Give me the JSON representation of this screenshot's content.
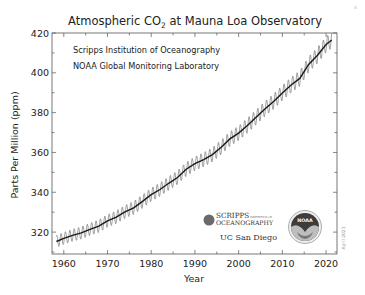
{
  "chart_data": {
    "type": "line",
    "title": "Atmospheric CO2 at Mauna Loa Observatory",
    "title_parts": {
      "pre": "Atmospheric CO",
      "sub": "2",
      "post": " at Mauna Loa Observatory"
    },
    "xlabel": "Year",
    "ylabel": "Parts Per Million (ppm)",
    "xlim": [
      1957.3,
      2022.5
    ],
    "ylim": [
      309,
      420
    ],
    "x_ticks": [
      1960,
      1970,
      1980,
      1990,
      2000,
      2010,
      2020
    ],
    "y_ticks": [
      320,
      340,
      360,
      380,
      400,
      420
    ],
    "grid": false,
    "legend": null,
    "annotations": [
      "Scripps Institution of Oceanography",
      "NOAA Global Monitoring Laboratory",
      "April 2021"
    ],
    "series": [
      {
        "name": "Annual mean CO2 (ppm, trend)",
        "x": [
          1958.3,
          1960,
          1962,
          1964,
          1966,
          1968,
          1970,
          1972,
          1974,
          1976,
          1978,
          1980,
          1982,
          1984,
          1986,
          1988,
          1990,
          1992,
          1994,
          1996,
          1998,
          2000,
          2002,
          2004,
          2006,
          2008,
          2010,
          2012,
          2014,
          2016,
          2018,
          2020,
          2021.3
        ],
        "values": [
          315.3,
          316.9,
          318.4,
          319.6,
          321.4,
          323.0,
          325.7,
          327.5,
          330.2,
          332.2,
          335.4,
          338.8,
          341.4,
          344.5,
          347.4,
          351.6,
          354.4,
          356.4,
          358.9,
          362.6,
          366.8,
          369.7,
          373.5,
          377.7,
          381.9,
          385.6,
          389.9,
          393.9,
          397.2,
          404.2,
          408.7,
          414.2,
          416.5
        ]
      },
      {
        "name": "Monthly CO2 (seasonal cycle)",
        "seasonal_amplitude_ppm": [
          3.0,
          4.0
        ]
      }
    ]
  },
  "labels": {
    "title_pre": "Atmospheric CO",
    "title_sub": "2",
    "title_post": " at Mauna Loa Observatory",
    "institution_1": "Scripps Institution of Oceanography",
    "institution_2": "NOAA Global Monitoring Laboratory",
    "xlabel": "Year",
    "ylabel": "Parts Per Million (ppm)",
    "date_note": "April 2021",
    "scripps_line1": "SCRIPPS",
    "scripps_tag": "INSTITUTION OF",
    "scripps_line2": "OCEANOGRAPHY",
    "ucsd": "UC San Diego",
    "noaa": "NOAA"
  },
  "colors": {
    "axis": "#555555",
    "trend": "#1a1a1a",
    "seasonal": "#777777",
    "noaa_dark": "#3c3c3c",
    "noaa_light": "#bdbdbd",
    "scripps_globe": "#6a6a6a"
  }
}
